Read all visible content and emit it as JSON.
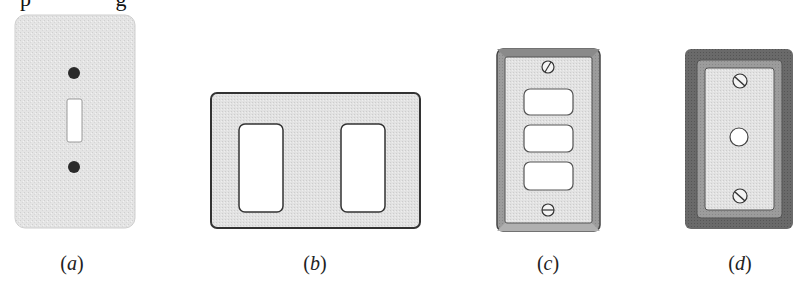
{
  "figure": {
    "top_fragment": "p              g",
    "panels": [
      {
        "id": "a",
        "label_letter": "a",
        "description": "textured single-toggle wall plate with two screws"
      },
      {
        "id": "b",
        "label_letter": "b",
        "description": "two-gang decorator wall plate with two rectangular openings"
      },
      {
        "id": "c",
        "label_letter": "c",
        "description": "beveled-frame plate with three rounded openings and two screws"
      },
      {
        "id": "d",
        "label_letter": "d",
        "description": "framed plate with single round center hole and two screws"
      }
    ]
  },
  "colors": {
    "plate_light": "#e6e6e6",
    "plate_mid": "#c9c9c9",
    "frame_dark": "#6e6e6e",
    "outline": "#333333",
    "screw_dark": "#2a2a2a",
    "hole": "#ffffff"
  }
}
